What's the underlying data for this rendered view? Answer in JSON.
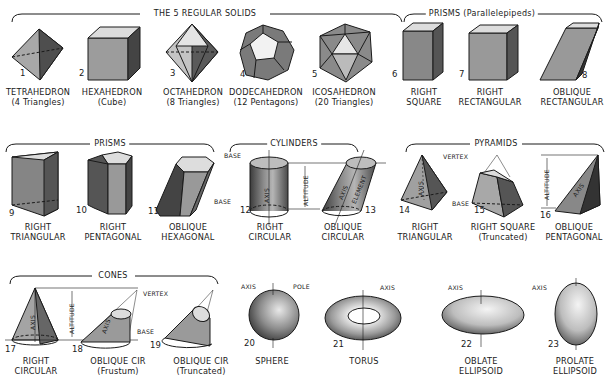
{
  "groups": {
    "regular_solids": "THE 5 REGULAR SOLIDS",
    "prisms_parallelepipeds": "PRISMS (Parallelepipeds)",
    "prisms": "PRISMS",
    "cylinders": "CYLINDERS",
    "pyramids": "PYRAMIDS",
    "cones": "CONES"
  },
  "solids": [
    {
      "num": "1",
      "line1": "TETRAHEDRON",
      "line2": "(4 Triangles)"
    },
    {
      "num": "2",
      "line1": "HEXAHEDRON",
      "line2": "(Cube)"
    },
    {
      "num": "3",
      "line1": "OCTAHEDRON",
      "line2": "(8 Triangles)"
    },
    {
      "num": "4",
      "line1": "DODECAHEDRON",
      "line2": "(12 Pentagons)"
    },
    {
      "num": "5",
      "line1": "ICOSAHEDRON",
      "line2": "(20 Triangles)"
    },
    {
      "num": "6",
      "line1": "RIGHT",
      "line2": "SQUARE"
    },
    {
      "num": "7",
      "line1": "RIGHT",
      "line2": "RECTANGULAR"
    },
    {
      "num": "8",
      "line1": "OBLIQUE",
      "line2": "RECTANGULAR"
    },
    {
      "num": "9",
      "line1": "RIGHT",
      "line2": "TRIANGULAR"
    },
    {
      "num": "10",
      "line1": "RIGHT",
      "line2": "PENTAGONAL"
    },
    {
      "num": "11",
      "line1": "OBLIQUE",
      "line2": "HEXAGONAL"
    },
    {
      "num": "12",
      "line1": "RIGHT",
      "line2": "CIRCULAR"
    },
    {
      "num": "13",
      "line1": "OBLIQUE",
      "line2": "CIRCULAR"
    },
    {
      "num": "14",
      "line1": "RIGHT",
      "line2": "TRIANGULAR"
    },
    {
      "num": "15",
      "line1": "RIGHT SQUARE",
      "line2": "(Truncated)"
    },
    {
      "num": "16",
      "line1": "OBLIQUE",
      "line2": "PENTAGONAL"
    },
    {
      "num": "17",
      "line1": "RIGHT",
      "line2": "CIRCULAR"
    },
    {
      "num": "18",
      "line1": "OBLIQUE CIR",
      "line2": "(Frustum)"
    },
    {
      "num": "19",
      "line1": "OBLIQUE CIR",
      "line2": "(Truncated)"
    },
    {
      "num": "20",
      "line1": "SPHERE",
      "line2": ""
    },
    {
      "num": "21",
      "line1": "TORUS",
      "line2": ""
    },
    {
      "num": "22",
      "line1": "OBLATE",
      "line2": "ELLIPSOID"
    },
    {
      "num": "23",
      "line1": "PROLATE",
      "line2": "ELLIPSOID"
    }
  ],
  "annotations": {
    "base": "BASE",
    "axis": "AXIS",
    "altitude": "ALTITUDE",
    "element": "ELEMENT",
    "vertex": "VERTEX",
    "pole": "POLE"
  },
  "colors": {
    "ink": "#1a1a1a",
    "shade_dark": "#5a5a5a",
    "shade_mid": "#9a9a9a",
    "shade_light": "#d8d8d8"
  }
}
